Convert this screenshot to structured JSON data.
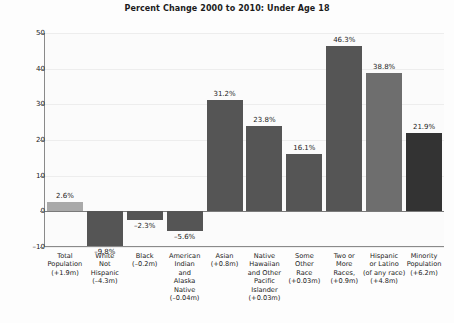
{
  "chart_data": {
    "type": "bar",
    "title": "Percent Change 2000 to 2010: Under Age 18",
    "xlabel": "",
    "ylabel": "",
    "ylim": [
      -10,
      50
    ],
    "yticks": [
      -10,
      0,
      10,
      20,
      30,
      40,
      50
    ],
    "ytick_labels": [
      "–10",
      "0",
      "10",
      "20",
      "30",
      "40",
      "50"
    ],
    "grid": true,
    "legend": "none",
    "categories": [
      "Total Population (+1.9m)",
      "White Not Hispanic (–4.3m)",
      "Black (–0.2m)",
      "American Indian and Alaska Native (–0.04m)",
      "Asian (+0.8m)",
      "Native Hawaiian and Other Pacific Islander (+0.03m)",
      "Some Other Race (+0.03m)",
      "Two or More Races, (+0.9m)",
      "Hispanic or Latino (of any race) (+4.8m)",
      "Minority Population (+6.2m)"
    ],
    "category_lines": [
      [
        "Total",
        "Population",
        "(+1.9m)"
      ],
      [
        "White",
        "Not",
        "Hispanic",
        "(–4.3m)"
      ],
      [
        "Black",
        "(–0.2m)"
      ],
      [
        "American",
        "Indian",
        "and",
        "Alaska",
        "Native",
        "(–0.04m)"
      ],
      [
        "Asian",
        "(+0.8m)"
      ],
      [
        "Native",
        "Hawaiian",
        "and Other",
        "Pacific",
        "Islander",
        "(+0.03m)"
      ],
      [
        "Some",
        "Other",
        "Race",
        "(+0.03m)"
      ],
      [
        "Two or",
        "More",
        "Races,",
        "(+0.9m)"
      ],
      [
        "Hispanic",
        "or Latino",
        "(of any race)",
        "(+4.8m)"
      ],
      [
        "Minority",
        "Population",
        "(+6.2m)"
      ]
    ],
    "values": [
      2.6,
      -9.8,
      -2.3,
      -5.6,
      31.2,
      23.8,
      16.1,
      46.3,
      38.8,
      21.9
    ],
    "value_labels": [
      "2.6%",
      "–9.8%",
      "–2.3%",
      "–5.6%",
      "31.2%",
      "23.8%",
      "16.1%",
      "46.3%",
      "38.8%",
      "21.9%"
    ],
    "bar_colors": [
      "#a9a9a9",
      "#555555",
      "#555555",
      "#555555",
      "#555555",
      "#555555",
      "#555555",
      "#555555",
      "#6e6e6e",
      "#333333"
    ],
    "axis_color": "#8a8a8a",
    "grid_color": "#ededed",
    "text_color": "#1b1b1b",
    "background": "#fdfdfd"
  }
}
